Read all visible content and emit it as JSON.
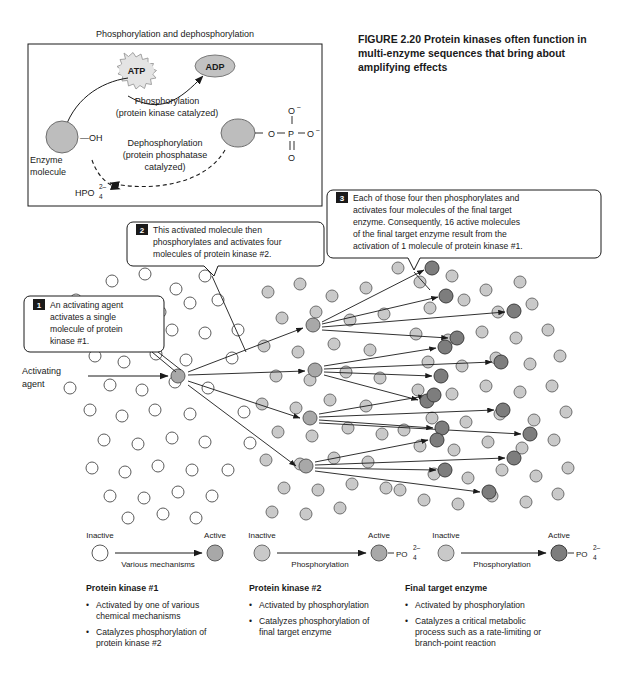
{
  "figure": {
    "title": "FIGURE 2.20  Protein kinases often function in multi-enzyme sequences that bring about amplifying effects",
    "title_lines": [
      "FIGURE 2.20  Protein kinases often function in",
      "multi-enzyme sequences that bring about",
      "amplifying effects"
    ]
  },
  "inset": {
    "title": "Phosphorylation and dephosphorylation",
    "atp_label": "ATP",
    "adp_label": "ADP",
    "forward_reaction_lines": [
      "Phosphorylation",
      "(protein kinase catalyzed)"
    ],
    "reverse_reaction_lines": [
      "Dephosphorylation",
      "(protein phosphatase",
      "catalyzed)"
    ],
    "enzyme_label_lines": [
      "Enzyme",
      "molecule"
    ],
    "hydroxyl_label": "—OH",
    "phosphate_atoms": {
      "o_link": "O",
      "p": "P",
      "o_top": "O",
      "o_right": "O",
      "o_bottom": "O",
      "charge": "–"
    },
    "inorganic_phosphate": {
      "formula": "HPO",
      "sub": "4",
      "sup": "2–"
    }
  },
  "callouts": [
    {
      "number": "1",
      "lines": [
        "An activating agent",
        "activates a single",
        "molecule of protein",
        "kinase #1."
      ]
    },
    {
      "number": "2",
      "lines": [
        "This activated molecule then",
        "phosphorylates and activates four",
        "molecules of protein kinase #2."
      ]
    },
    {
      "number": "3",
      "lines": [
        "Each of those four then phosphorylates and",
        "activates four molecules of the final target",
        "enzyme. Consequently, 16 active molecules",
        "of the final target enzyme result from the",
        "activation of 1 molecule of protein kinase #1."
      ]
    }
  ],
  "cascade": {
    "activating_agent_lines": [
      "Activating",
      "agent"
    ],
    "tier1_count": 1,
    "tier2_count": 4,
    "tier3_count": 16
  },
  "legend": {
    "stages": [
      {
        "inactive_label": "Inactive",
        "active_label": "Active",
        "arrow_label": "Various mechanisms",
        "inactive_state": "white",
        "active_state": "mid",
        "phosphate": null
      },
      {
        "inactive_label": "Inactive",
        "active_label": "Active",
        "arrow_label": "Phosphorylation",
        "inactive_state": "light",
        "active_state": "mid",
        "phosphate": {
          "formula": "PO",
          "sub": "4",
          "sup": "2–"
        }
      },
      {
        "inactive_label": "Inactive",
        "active_label": "Active",
        "arrow_label": "Phosphorylation",
        "inactive_state": "light",
        "active_state": "dark",
        "phosphate": {
          "formula": "PO",
          "sub": "4",
          "sup": "2–"
        }
      }
    ]
  },
  "columns": [
    {
      "heading": "Protein kinase #1",
      "items": [
        [
          "Activated by one of various",
          "chemical mechanisms"
        ],
        [
          "Catalyzes phosphorylation of",
          "protein kinase #2"
        ]
      ]
    },
    {
      "heading": "Protein kinase #2",
      "items": [
        [
          "Activated by phosphorylation"
        ],
        [
          "Catalyzes phosphorylation of",
          "final target enzyme"
        ]
      ]
    },
    {
      "heading": "Final target enzyme",
      "items": [
        [
          "Activated by phosphorylation"
        ],
        [
          "Catalyzes a critical metabolic",
          "process such as a rate-limiting or",
          "branch-point reaction"
        ]
      ]
    }
  ],
  "colors": {
    "ink": "#1a1a1a",
    "inactive_white": "#ffffff",
    "inactive_light": "#c9c9c9",
    "active_mid": "#a8a8a8",
    "active_dark": "#7d7d7d",
    "enzyme_fill": "#bdbdbd"
  }
}
